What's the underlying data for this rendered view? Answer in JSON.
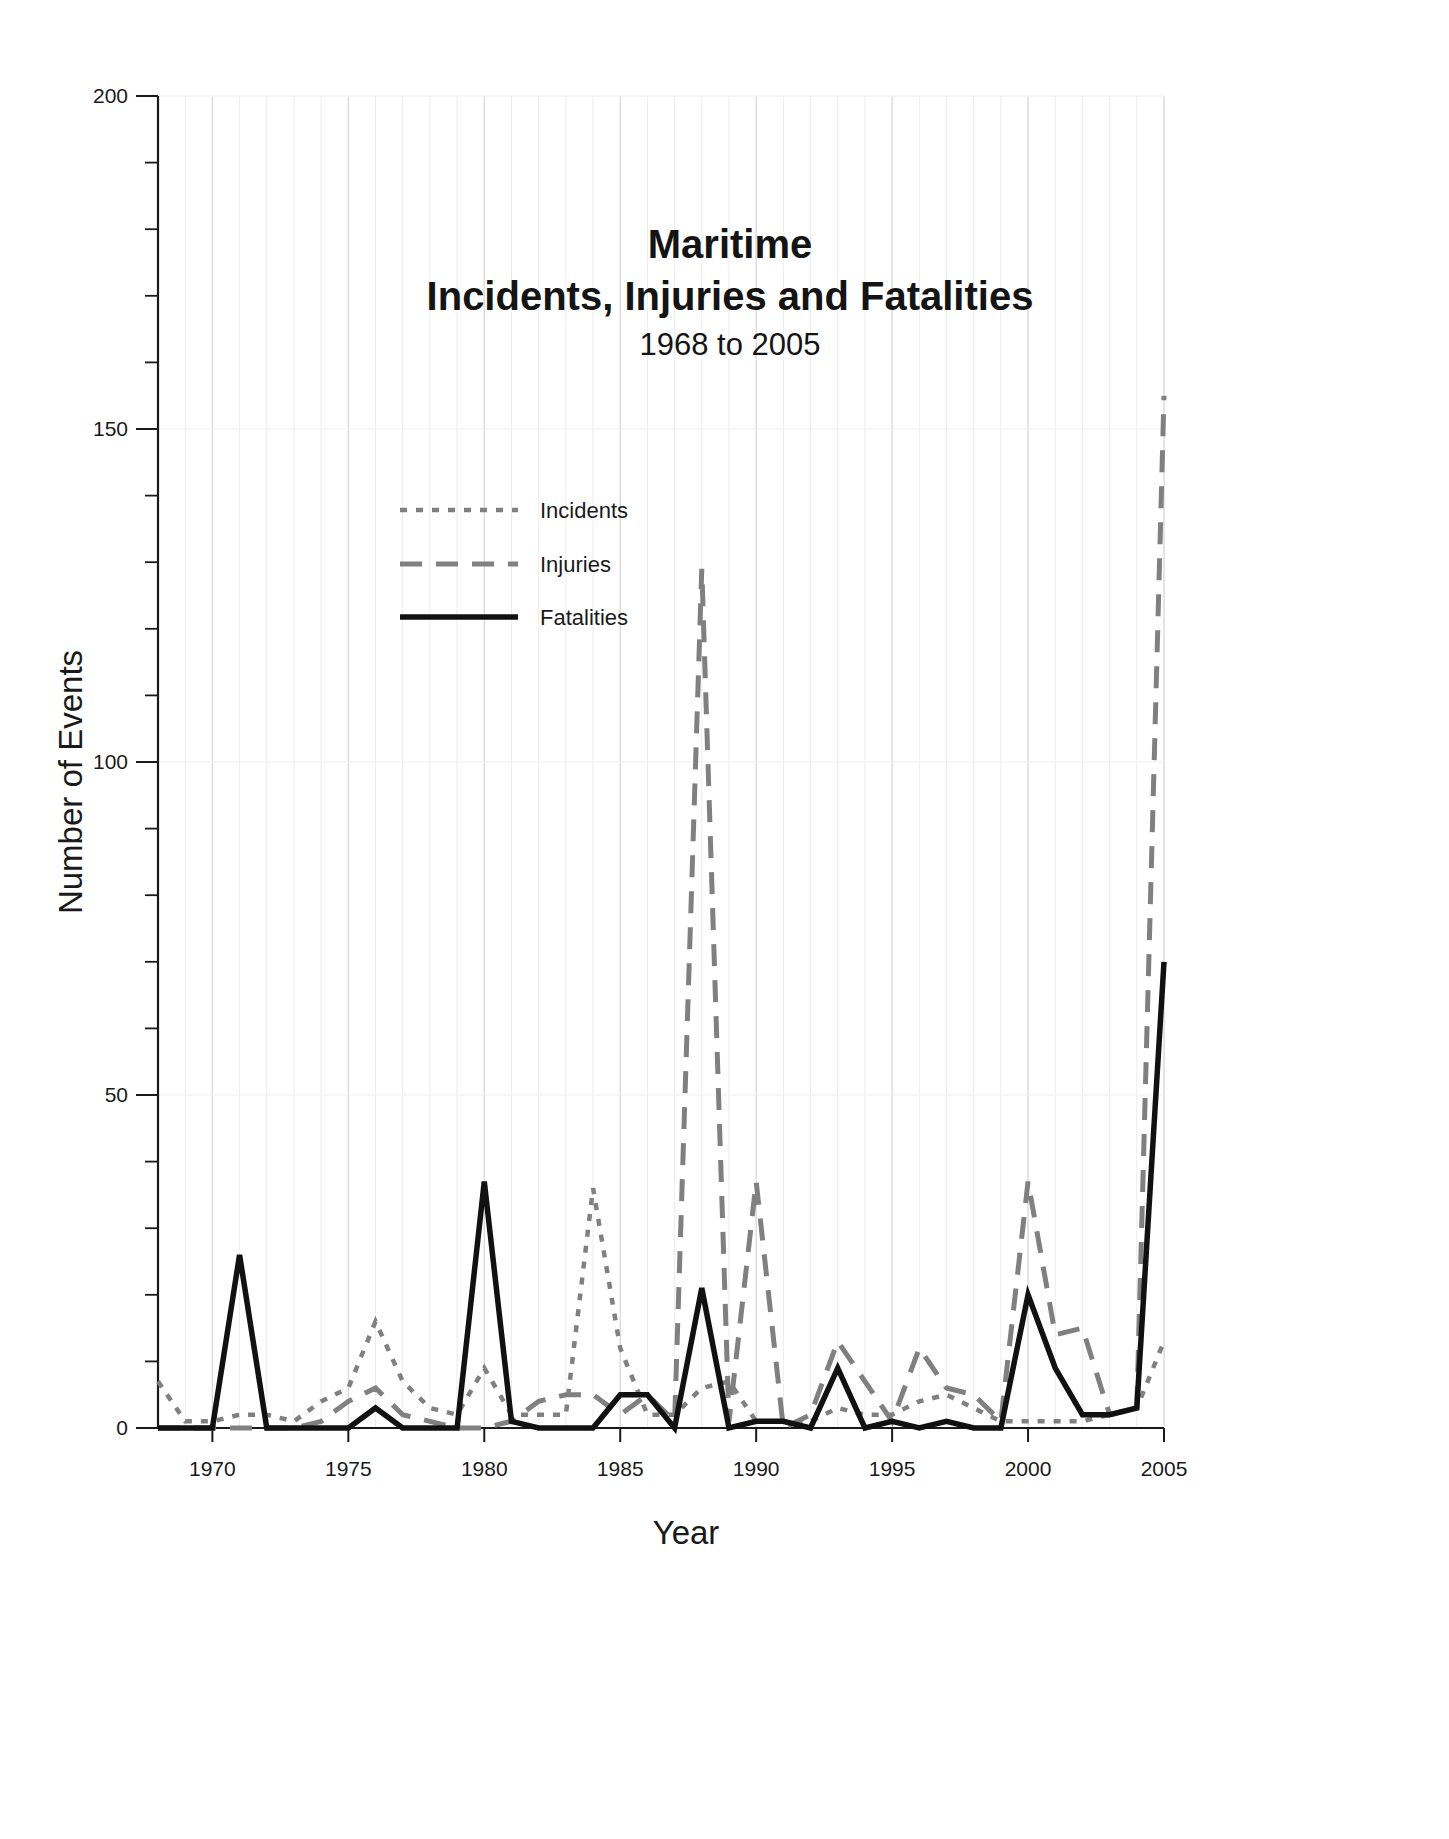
{
  "chart_data": {
    "type": "line",
    "title": "Maritime",
    "title_line2": "Incidents, Injuries and Fatalities",
    "subtitle": "1968 to 2005",
    "xlabel": "Year",
    "ylabel": "Number of Events",
    "xlim": [
      1968,
      2005
    ],
    "ylim": [
      0,
      200
    ],
    "yticks": [
      0,
      50,
      100,
      150,
      200
    ],
    "ytick_labels": [
      "0",
      "50",
      "100",
      "150",
      "200"
    ],
    "y_minor_step": 10,
    "xticks": [
      1970,
      1975,
      1980,
      1985,
      1990,
      1995,
      2000,
      2005
    ],
    "xtick_labels": [
      "1970",
      "1975",
      "1980",
      "1985",
      "1990",
      "1995",
      "2000",
      "2005"
    ],
    "grid": "vertical-major-and-minor, horizontal-faint",
    "legend_position": "upper-left-inside",
    "x": [
      1968,
      1969,
      1970,
      1971,
      1972,
      1973,
      1974,
      1975,
      1976,
      1977,
      1978,
      1979,
      1980,
      1981,
      1982,
      1983,
      1984,
      1985,
      1986,
      1987,
      1988,
      1989,
      1990,
      1991,
      1992,
      1993,
      1994,
      1995,
      1996,
      1997,
      1998,
      1999,
      2000,
      2001,
      2002,
      2003,
      2004,
      2005
    ],
    "series": [
      {
        "name": "Incidents",
        "style": "dotted",
        "color": "#808080",
        "values": [
          7,
          1,
          1,
          2,
          2,
          1,
          4,
          6,
          16,
          7,
          3,
          2,
          9,
          2,
          2,
          2,
          36,
          12,
          2,
          2,
          6,
          7,
          1,
          1,
          1,
          3,
          2,
          2,
          4,
          5,
          3,
          1,
          1,
          1,
          1,
          2,
          3,
          13
        ]
      },
      {
        "name": "Injuries",
        "style": "dashed",
        "color": "#808080",
        "values": [
          0,
          0,
          0,
          0,
          0,
          0,
          1,
          4,
          6,
          2,
          1,
          0,
          0,
          1,
          4,
          5,
          5,
          2,
          5,
          1,
          129,
          1,
          37,
          0,
          2,
          13,
          7,
          1,
          12,
          6,
          5,
          1,
          37,
          14,
          15,
          2,
          3,
          155
        ]
      },
      {
        "name": "Fatalities",
        "style": "solid",
        "color": "#111111",
        "values": [
          0,
          0,
          0,
          26,
          0,
          0,
          0,
          0,
          3,
          0,
          0,
          0,
          37,
          1,
          0,
          0,
          0,
          5,
          5,
          0,
          21,
          0,
          1,
          1,
          0,
          9,
          0,
          1,
          0,
          1,
          0,
          0,
          20,
          9,
          2,
          2,
          3,
          70
        ]
      }
    ]
  },
  "legend": {
    "items": [
      {
        "label": "Incidents"
      },
      {
        "label": "Injuries"
      },
      {
        "label": "Fatalities"
      }
    ]
  },
  "colors": {
    "axis": "#1a1a1a",
    "grid_major": "#d9d9d9",
    "grid_minor": "#ededed",
    "incidents": "#808080",
    "injuries": "#808080",
    "fatalities": "#111111",
    "background": "#ffffff"
  }
}
